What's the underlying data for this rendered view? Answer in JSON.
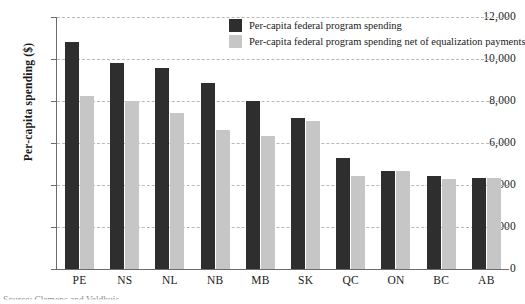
{
  "chart_data": {
    "type": "bar",
    "title": "",
    "xlabel": "",
    "ylabel": "Per-capita spending ($)",
    "ylim": [
      0,
      12000
    ],
    "ytick_values": [
      12000,
      10000,
      8000,
      6000,
      4000,
      2000,
      0
    ],
    "ytick_labels": [
      "12,000",
      "10,000",
      "8,000",
      "6,000",
      "4,000",
      "2,000",
      "0"
    ],
    "grid": true,
    "grid_style": "dashed-horizontal",
    "legend_position": "top-right",
    "categories": [
      "PE",
      "NS",
      "NL",
      "NB",
      "MB",
      "SK",
      "QC",
      "ON",
      "BC",
      "AB"
    ],
    "series": [
      {
        "name": "Per-capita federal program spending",
        "color": "#2e2e2e",
        "values": [
          10800,
          9800,
          9550,
          8850,
          8000,
          7200,
          5300,
          4650,
          4450,
          4350
        ]
      },
      {
        "name": "Per-capita federal program spending net of equalization payments",
        "color": "#c6c6c6",
        "values": [
          8250,
          7980,
          7450,
          6600,
          6350,
          7050,
          4450,
          4650,
          4300,
          4350
        ]
      }
    ]
  },
  "legend": {
    "items": [
      {
        "label": "Per-capita federal program spending",
        "color": "#2e2e2e"
      },
      {
        "label": "Per-capita federal program spending net of equalization payments",
        "color": "#c6c6c6"
      }
    ]
  },
  "source_note": "Source: Clemens and Veldhuis",
  "colors": {
    "bar_dark": "#2e2e2e",
    "bar_light": "#c6c6c6",
    "axis": "#6b6b6b",
    "gridline": "#b9b9b9",
    "background": "#ffffff"
  }
}
